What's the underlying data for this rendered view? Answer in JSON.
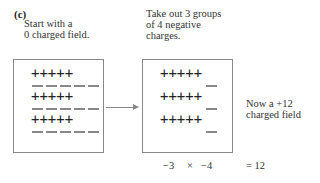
{
  "panel_label": "(c)",
  "left": {
    "caption_lines": [
      "Start with a",
      "0 charged field."
    ],
    "rows": [
      {
        "positives": "+++++",
        "negatives": 5
      },
      {
        "positives": "+++++",
        "negatives": 5
      },
      {
        "positives": "+++++",
        "negatives": 5
      }
    ]
  },
  "right": {
    "caption_lines": [
      "Take out 3 groups",
      "of 4 negative",
      "charges."
    ],
    "rows": [
      {
        "positives": "+++++",
        "negatives": 1
      },
      {
        "positives": "+++++",
        "negatives": 1
      },
      {
        "positives": "+++++",
        "negatives": 1
      }
    ]
  },
  "result_caption_lines": [
    "Now a +12",
    "charged field"
  ],
  "equation": {
    "left_operand": "−3",
    "operator": "×",
    "right_operand": "−4",
    "result": "= 12"
  },
  "colors": {
    "text": "#333333",
    "border": "#888888",
    "negative": "#888888"
  }
}
